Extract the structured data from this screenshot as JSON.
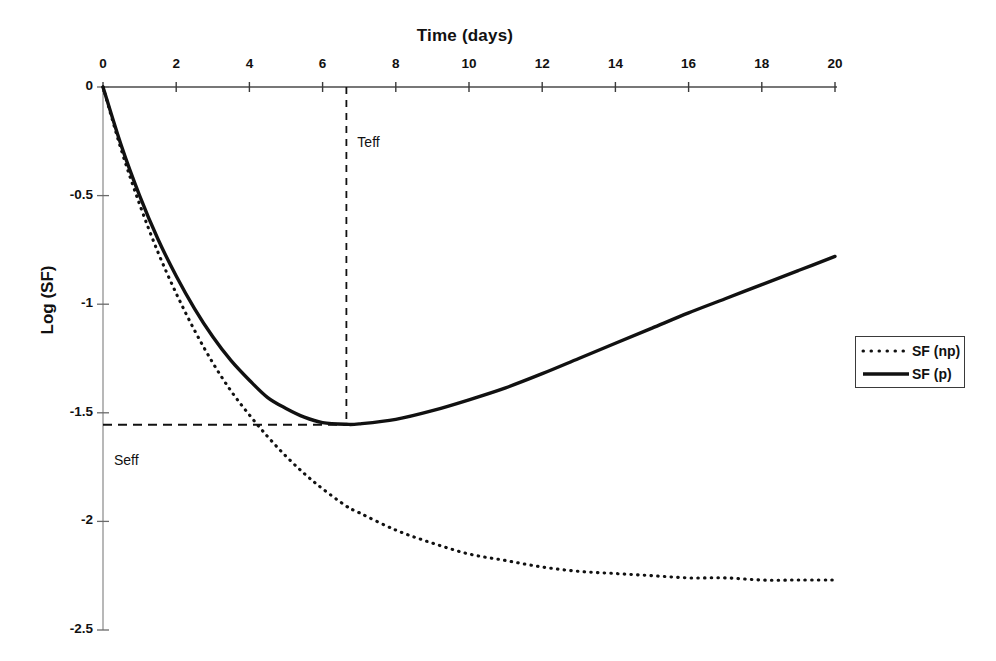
{
  "chart_data": {
    "type": "line",
    "title": "Time (days)",
    "xlabel": "Time (days)",
    "ylabel": "Log (SF)",
    "xlim": [
      0,
      20
    ],
    "ylim": [
      -2.5,
      0
    ],
    "grid": false,
    "x_axis_position": "top",
    "legend_position": "right",
    "xticks": [
      "0",
      "2",
      "4",
      "6",
      "8",
      "10",
      "12",
      "14",
      "16",
      "18",
      "20"
    ],
    "xtick_values": [
      0,
      2,
      4,
      6,
      8,
      10,
      12,
      14,
      16,
      18,
      20
    ],
    "yticks": [
      "0",
      "-0.5",
      "-1",
      "-1.5",
      "-2",
      "-2.5"
    ],
    "ytick_values": [
      0,
      -0.5,
      -1,
      -1.5,
      -2,
      -2.5
    ],
    "series": [
      {
        "name": "SF (np)",
        "style": "dotted",
        "color": "#111111",
        "x": [
          0,
          0.5,
          1,
          1.5,
          2,
          2.5,
          3,
          3.5,
          4,
          4.5,
          5,
          5.5,
          6,
          6.65,
          7,
          8,
          9,
          10,
          11,
          12,
          13,
          14,
          15,
          16,
          17,
          18,
          19,
          20
        ],
        "values": [
          0,
          -0.29,
          -0.54,
          -0.76,
          -0.95,
          -1.12,
          -1.27,
          -1.4,
          -1.51,
          -1.61,
          -1.7,
          -1.78,
          -1.85,
          -1.93,
          -1.96,
          -2.04,
          -2.1,
          -2.15,
          -2.18,
          -2.21,
          -2.23,
          -2.24,
          -2.25,
          -2.26,
          -2.26,
          -2.27,
          -2.27,
          -2.27
        ]
      },
      {
        "name": "SF (p)",
        "style": "solid",
        "color": "#111111",
        "x": [
          0,
          0.5,
          1,
          1.5,
          2,
          2.5,
          3,
          3.5,
          4,
          4.5,
          5,
          5.5,
          6,
          6.65,
          7,
          8,
          9,
          10,
          11,
          12,
          13,
          14,
          15,
          16,
          17,
          18,
          19,
          20
        ],
        "values": [
          0,
          -0.27,
          -0.5,
          -0.7,
          -0.87,
          -1.02,
          -1.15,
          -1.26,
          -1.35,
          -1.43,
          -1.48,
          -1.52,
          -1.545,
          -1.553,
          -1.551,
          -1.53,
          -1.49,
          -1.44,
          -1.385,
          -1.32,
          -1.25,
          -1.18,
          -1.11,
          -1.04,
          -0.975,
          -0.91,
          -0.845,
          -0.78
        ]
      }
    ],
    "annotations": [
      {
        "label": "Teff",
        "type": "vertical-dashed-line",
        "x": 6.65,
        "y_from": 0,
        "y_to": -1.55,
        "label_x": 6.95,
        "label_y": -0.26
      },
      {
        "label": "Seff",
        "type": "horizontal-dashed-line",
        "y": -1.555,
        "x_from": 0,
        "x_to": 6.65,
        "label_x": 0.3,
        "label_y": -1.72
      }
    ]
  },
  "legend": {
    "entries": [
      {
        "label": "SF (np)",
        "style": "dotted"
      },
      {
        "label": "SF (p)",
        "style": "solid"
      }
    ]
  }
}
